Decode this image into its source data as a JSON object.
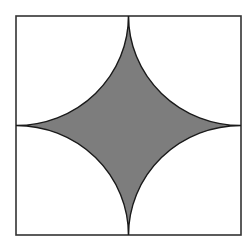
{
  "figure": {
    "square": {
      "x": 16,
      "y": 16,
      "width": 225,
      "height": 219
    },
    "colors": {
      "background": "#ffffff",
      "fill": "#7d7d7d",
      "stroke": "#1a1a1a",
      "border": "#333333"
    }
  }
}
